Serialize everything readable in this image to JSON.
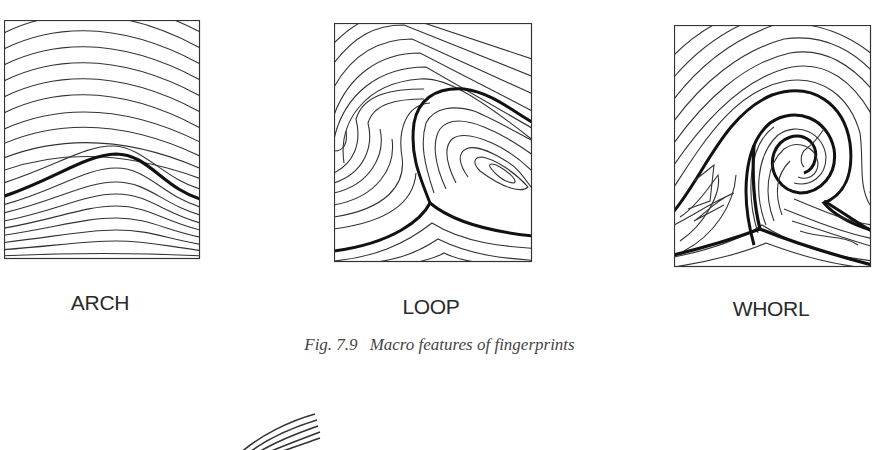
{
  "figure": {
    "number": "Fig. 7.9",
    "caption": "Macro features of fingerprints",
    "panels": [
      {
        "id": "arch",
        "label": "ARCH"
      },
      {
        "id": "loop",
        "label": "LOOP"
      },
      {
        "id": "whorl",
        "label": "WHORL"
      }
    ]
  },
  "colors": {
    "ink": "#2a2a2a",
    "caption": "#444444",
    "background": "#ffffff"
  }
}
